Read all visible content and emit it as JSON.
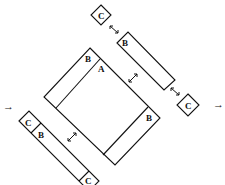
{
  "diagram": {
    "labels": {
      "main_inner": "A",
      "main_top_strip": "B",
      "main_right_strip": "B",
      "upper_strip": "B",
      "lower_strip": "B",
      "top_block": "C",
      "right_block": "C",
      "lower_left_block": "C",
      "lower_bottom_block": "C"
    },
    "arrows": {
      "input_arrow": "→",
      "output_arrow": "→"
    },
    "colors": {
      "stroke": "#111111",
      "background": "#ffffff"
    }
  }
}
